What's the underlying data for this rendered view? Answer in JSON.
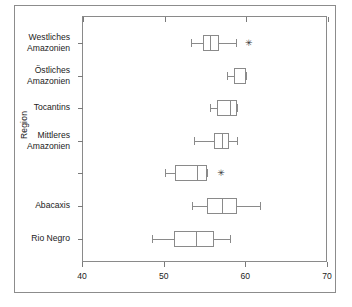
{
  "chart_data": {
    "type": "box",
    "orientation": "horizontal",
    "title": "",
    "xlabel": "",
    "ylabel": "Region",
    "xlim": [
      40,
      70
    ],
    "xticks": [
      40,
      50,
      60,
      70
    ],
    "xtick_labels": [
      "40",
      "50",
      "60",
      "70"
    ],
    "grid": false,
    "legend": "none",
    "categories": [
      "Westliches\nAmazonien",
      "Östliches\nAmazonien",
      "Tocantins",
      "Mittleres\nAmazonien",
      "",
      "Abacaxis",
      "Rio Negro"
    ],
    "boxes": [
      {
        "category": "Westliches Amazonien",
        "whisker_low": 53.2,
        "q1": 54.7,
        "median": 55.6,
        "q3": 56.7,
        "whisker_high": 58.7,
        "outliers": [
          60.3
        ]
      },
      {
        "category": "Östliches Amazonien",
        "whisker_low": 57.6,
        "q1": 58.5,
        "median": 58.5,
        "q3": 59.9,
        "whisker_high": 59.9,
        "outliers": []
      },
      {
        "category": "Tocantins",
        "whisker_low": 55.6,
        "q1": 56.4,
        "median": 58.0,
        "q3": 58.9,
        "whisker_high": 58.9,
        "outliers": []
      },
      {
        "category": "Mittleres Amazonien",
        "whisker_low": 53.6,
        "q1": 56.1,
        "median": 57.0,
        "q3": 57.9,
        "whisker_high": 58.9,
        "outliers": []
      },
      {
        "category": "",
        "whisker_low": 50.1,
        "q1": 51.3,
        "median": 54.0,
        "q3": 55.2,
        "whisker_high": 55.2,
        "outliers": [
          56.9
        ]
      },
      {
        "category": "Abacaxis",
        "whisker_low": 53.4,
        "q1": 55.2,
        "median": 57.0,
        "q3": 58.8,
        "whisker_high": 61.7,
        "outliers": []
      },
      {
        "category": "Rio Negro",
        "whisker_low": 48.4,
        "q1": 51.2,
        "median": 53.8,
        "q3": 56.0,
        "whisker_high": 58.0,
        "outliers": []
      }
    ]
  },
  "axis": {
    "ylabel": "Region",
    "xtick_0": "40",
    "xtick_1": "50",
    "xtick_2": "60",
    "xtick_3": "70"
  },
  "labels": {
    "cat_0": "Westliches\nAmazonien",
    "cat_1": "Östliches\nAmazonien",
    "cat_2": "Tocantins",
    "cat_3": "Mittleres\nAmazonien",
    "cat_4": "",
    "cat_5": "Abacaxis",
    "cat_6": "Rio Negro"
  },
  "marks": {
    "outlier_glyph": "✳"
  }
}
